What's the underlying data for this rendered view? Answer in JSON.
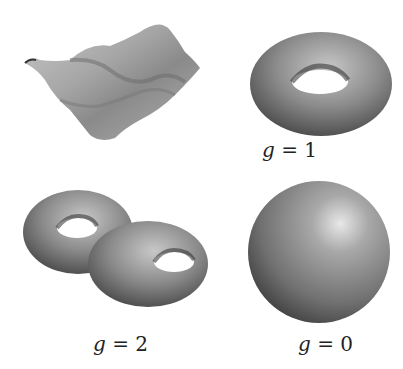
{
  "figure": {
    "panels": [
      {
        "name": "wavy-surface",
        "shape": "surface",
        "label": ""
      },
      {
        "name": "torus",
        "shape": "torus",
        "label": "g = 1"
      },
      {
        "name": "double-torus",
        "shape": "double-torus",
        "label": "g = 2"
      },
      {
        "name": "sphere",
        "shape": "sphere",
        "label": "g = 0"
      }
    ],
    "labels": {
      "g1": {
        "var": "g",
        "eq": " = ",
        "val": "1"
      },
      "g2": {
        "var": "g",
        "eq": " = ",
        "val": "2"
      },
      "g0": {
        "var": "g",
        "eq": " = ",
        "val": "0"
      }
    }
  }
}
